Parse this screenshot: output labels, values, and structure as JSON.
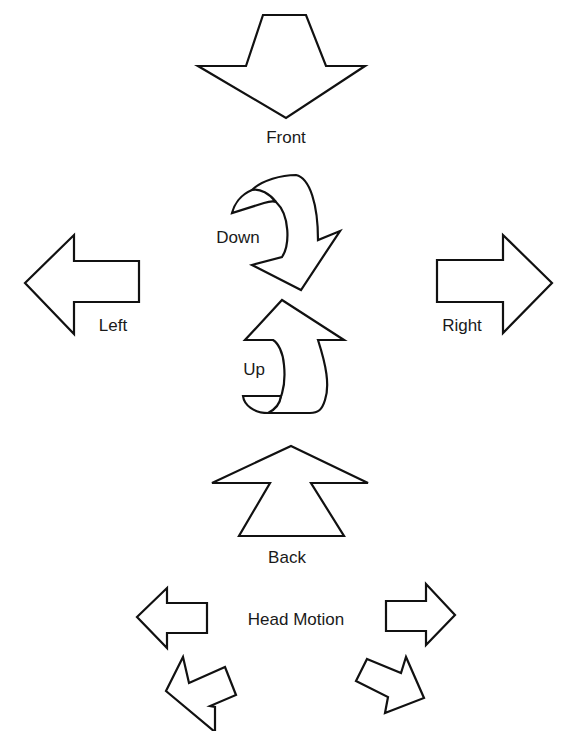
{
  "diagram": {
    "labels": {
      "front": "Front",
      "back": "Back",
      "left": "Left",
      "right": "Right",
      "down": "Down",
      "up": "Up",
      "head_motion": "Head Motion"
    },
    "colors": {
      "stroke": "#111111",
      "fill": "#ffffff",
      "text": "#1a1a1a",
      "background": "#ffffff"
    }
  }
}
